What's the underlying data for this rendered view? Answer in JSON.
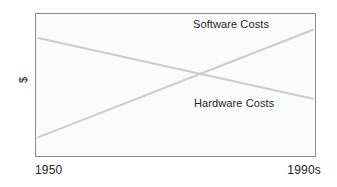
{
  "chart_data": {
    "type": "line",
    "title": "",
    "subtitle": "",
    "xlabel": "",
    "ylabel": "$",
    "grid": false,
    "legend_position": "inline-annotation",
    "x_tick_labels": [
      "1950",
      "1990s"
    ],
    "y_tick_labels": [],
    "xlim": [
      1950,
      1999
    ],
    "ylim": [
      0,
      100
    ],
    "annotations": [
      {
        "text": "Software Costs",
        "series": "Software Costs",
        "position": "top-right"
      },
      {
        "text": "Hardware Costs",
        "series": "Hardware Costs",
        "position": "bottom-right"
      }
    ],
    "series": [
      {
        "name": "Software Costs",
        "color": "#cccccc",
        "x": [
          1950,
          1999
        ],
        "values": [
          12,
          90
        ],
        "trend": "increasing"
      },
      {
        "name": "Hardware Costs",
        "color": "#cccccc",
        "x": [
          1950,
          1999
        ],
        "values": [
          84,
          40
        ],
        "trend": "decreasing"
      }
    ]
  },
  "figure": {
    "y_axis_label": "$",
    "x_start_label": "1950",
    "x_end_label": "1990s",
    "software_label": "Software Costs",
    "hardware_label": "Hardware Costs"
  },
  "colors": {
    "line": "#cccccc",
    "frame": "#8a8a8a",
    "plot_background": "#fbfbfb",
    "page_background": "#ffffff",
    "text": "#1c1c1c"
  }
}
